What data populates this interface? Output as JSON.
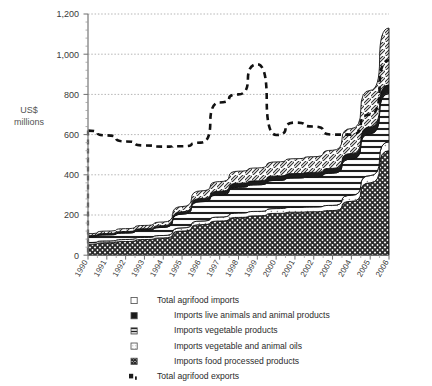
{
  "chart_data": {
    "type": "area",
    "title": "",
    "subtitle": "",
    "xlabel": "",
    "ylabel": "US$ millions",
    "ylabel_line1": "US$",
    "ylabel_line2": "millions",
    "ylim": [
      0,
      1200
    ],
    "ytick_step": 200,
    "yticks": [
      0,
      200,
      400,
      600,
      800,
      1000,
      1200
    ],
    "ytick_labels": [
      "0",
      "200",
      "400",
      "600",
      "800",
      "1,000",
      "1,200"
    ],
    "grid": true,
    "grid_style": "dotted-horizontal",
    "legend_position": "bottom",
    "stacked": true,
    "categories": [
      "1990",
      "1991",
      "1992",
      "1993",
      "1994",
      "1995",
      "1996",
      "1997",
      "1998",
      "1999",
      "2000",
      "2001",
      "2002",
      "2003",
      "2004",
      "2005",
      "2006"
    ],
    "x": [
      1990,
      1991,
      1992,
      1993,
      1994,
      1995,
      1996,
      1997,
      1998,
      1999,
      2000,
      2001,
      2002,
      2003,
      2004,
      2005,
      2006
    ],
    "series": [
      {
        "name": "Imports food processed products",
        "legend_label": "Imports food processed products",
        "swatch": "cross-hatch-dense",
        "stack_order": 1,
        "values": [
          55,
          62,
          68,
          78,
          86,
          120,
          152,
          170,
          188,
          196,
          208,
          214,
          216,
          222,
          268,
          360,
          520
        ]
      },
      {
        "name": "Imports vegetable and animal oils",
        "legend_label": "Imports vegetable and animal oils",
        "swatch": "light-dots",
        "stack_order": 2,
        "values": [
          8,
          9,
          10,
          11,
          12,
          16,
          18,
          20,
          22,
          22,
          24,
          24,
          24,
          26,
          30,
          36,
          44
        ]
      },
      {
        "name": "Imports vegetable products",
        "legend_label": "Imports vegetable products",
        "swatch": "horizontal-lines",
        "stack_order": 3,
        "values": [
          28,
          30,
          32,
          35,
          40,
          68,
          96,
          110,
          128,
          132,
          140,
          146,
          150,
          160,
          180,
          208,
          240
        ]
      },
      {
        "name": "Imports live animals and animal products",
        "legend_label": "Imports live animals and animal products",
        "swatch": "solid-dark",
        "stack_order": 4,
        "values": [
          6,
          7,
          8,
          8,
          9,
          12,
          16,
          18,
          20,
          20,
          22,
          22,
          22,
          24,
          28,
          34,
          44
        ]
      },
      {
        "name": "Total agrifood imports",
        "legend_label": "Total agrifood imports",
        "swatch": "open-white",
        "stack_order": 5,
        "values": [
          10,
          12,
          14,
          16,
          18,
          26,
          38,
          48,
          60,
          64,
          70,
          74,
          78,
          90,
          124,
          182,
          282
        ]
      }
    ],
    "line_series": [
      {
        "name": "Total agrifood exports",
        "legend_label": "Total agrifood exports",
        "style": "thick-dashed",
        "color": "#111111",
        "values": [
          620,
          596,
          566,
          546,
          540,
          542,
          560,
          588,
          760,
          790,
          800,
          950,
          700,
          598,
          608,
          600,
          620,
          800,
          970
        ],
        "values_by_year": {
          "1990": 620,
          "1991": 596,
          "1992": 566,
          "1993": 546,
          "1994": 540,
          "1995": 542,
          "1996": 560,
          "1997": 760,
          "1998": 800,
          "1999": 950,
          "2000": 598,
          "2001": 660,
          "2002": 640,
          "2003": 600,
          "2004": 600,
          "2005": 700,
          "2006": 970
        }
      }
    ],
    "annotations": []
  },
  "legend": {
    "items": [
      {
        "label": "Total agrifood imports",
        "swatch": "open-white"
      },
      {
        "label": "Imports live animals and animal products",
        "swatch": "solid-dark"
      },
      {
        "label": "Imports vegetable products",
        "swatch": "horizontal-lines"
      },
      {
        "label": "Imports vegetable and animal oils",
        "swatch": "light-dots"
      },
      {
        "label": "Imports food processed products",
        "swatch": "cross-hatch-dense"
      },
      {
        "label": "Total agrifood exports",
        "swatch": "dashed-line"
      }
    ]
  },
  "colors": {
    "axis": "#8a8a8a",
    "grid": "#bdbdbd",
    "text": "#2b2b2b",
    "line": "#111111",
    "fill_dark": "#2f2f2f",
    "background": "#ffffff"
  }
}
